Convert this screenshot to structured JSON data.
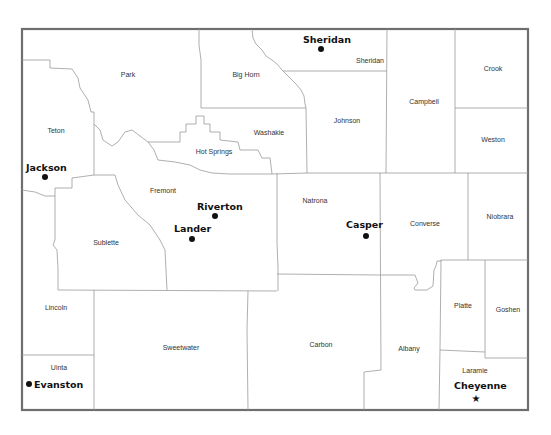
{
  "map": {
    "state": "Wyoming",
    "counties": [
      {
        "name": "Park",
        "x": 128,
        "y": 77
      },
      {
        "name": "Big Horn",
        "x": 246,
        "y": 77
      },
      {
        "name": "Sheridan",
        "x": 370,
        "y": 63
      },
      {
        "name": "Crook",
        "x": 493,
        "y": 71
      },
      {
        "name": "Teton",
        "x": 56,
        "y": 133
      },
      {
        "name": "Washakie",
        "x": 269,
        "y": 135
      },
      {
        "name": "Johnson",
        "x": 347,
        "y": 123
      },
      {
        "name": "Campbell",
        "x": 424,
        "y": 104
      },
      {
        "name": "Weston",
        "x": 493,
        "y": 142
      },
      {
        "name": "Hot Springs",
        "x": 214,
        "y": 154
      },
      {
        "name": "Fremont",
        "x": 163,
        "y": 193
      },
      {
        "name": "Natrona",
        "x": 315,
        "y": 203
      },
      {
        "name": "Converse",
        "x": 425,
        "y": 226
      },
      {
        "name": "Niobrara",
        "x": 500,
        "y": 219
      },
      {
        "name": "Sublette",
        "x": 106,
        "y": 245
      },
      {
        "name": "Lincoln",
        "x": 56,
        "y": 310
      },
      {
        "name": "Platte",
        "x": 463,
        "y": 308
      },
      {
        "name": "Goshen",
        "x": 508,
        "y": 312
      },
      {
        "name": "Sweetwater",
        "x": 181,
        "y": 350
      },
      {
        "name": "Carbon",
        "x": 321,
        "y": 347
      },
      {
        "name": "Albany",
        "x": 409,
        "y": 351
      },
      {
        "name": "Uinta",
        "x": 59,
        "y": 370
      },
      {
        "name": "Laramie",
        "x": 475,
        "y": 373
      }
    ],
    "cities": [
      {
        "name": "Sheridan",
        "label_x": 303,
        "label_y": 43,
        "dot_x": 321,
        "dot_y": 49,
        "type": "city"
      },
      {
        "name": "Jackson",
        "label_x": 26,
        "label_y": 171,
        "dot_x": 45,
        "dot_y": 177,
        "type": "city"
      },
      {
        "name": "Riverton",
        "label_x": 197,
        "label_y": 210,
        "dot_x": 215,
        "dot_y": 216,
        "type": "city"
      },
      {
        "name": "Lander",
        "label_x": 174,
        "label_y": 232,
        "dot_x": 192,
        "dot_y": 239,
        "type": "city"
      },
      {
        "name": "Casper",
        "label_x": 346,
        "label_y": 228,
        "dot_x": 366,
        "dot_y": 236,
        "type": "city"
      },
      {
        "name": "Evanston",
        "label_x": 34,
        "label_y": 388,
        "dot_x": 29,
        "dot_y": 384,
        "type": "city"
      },
      {
        "name": "Cheyenne",
        "label_x": 454,
        "label_y": 389,
        "dot_x": 476,
        "dot_y": 399,
        "type": "capital"
      }
    ],
    "symbols": {
      "city_dot": "filled-circle",
      "capital": "star"
    },
    "colors": {
      "frame": "#6e6e6e",
      "county_border": "#9a9a9a",
      "text": "#111111",
      "background": "#ffffff"
    }
  }
}
